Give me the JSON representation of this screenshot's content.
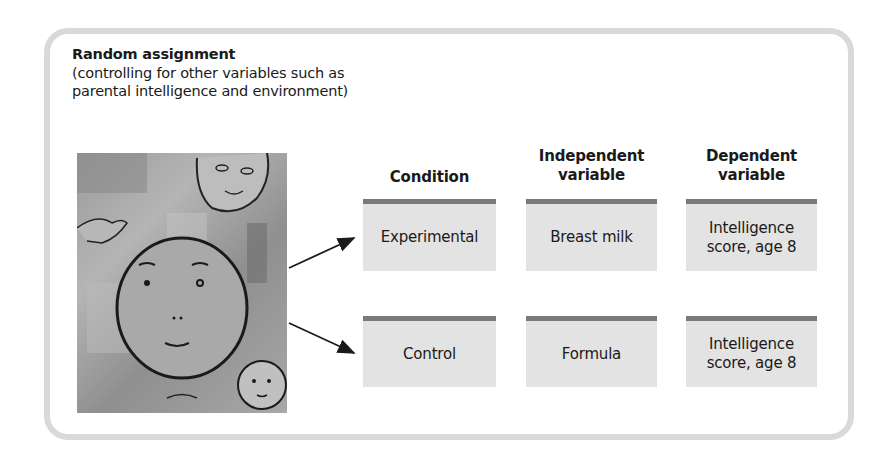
{
  "intro": {
    "title": "Random assignment",
    "description": "(controlling for other variables such as parental intelligence and environment)"
  },
  "illustration": {
    "subject": "children-faces-artwork",
    "colors": {
      "background": "#a0a0a0",
      "line": "#1a1a1a"
    }
  },
  "columns": [
    {
      "header": "Condition"
    },
    {
      "header_line1": "Independent",
      "header_line2": "variable"
    },
    {
      "header_line1": "Dependent",
      "header_line2": "variable"
    }
  ],
  "rows": [
    {
      "condition": "Experimental",
      "independent": "Breast milk",
      "dependent_line1": "Intelligence",
      "dependent_line2": "score, age 8"
    },
    {
      "condition": "Control",
      "independent": "Formula",
      "dependent_line1": "Intelligence",
      "dependent_line2": "score, age 8"
    }
  ],
  "colors": {
    "frame": "#d9d9d9",
    "box_fill": "#e3e3e3",
    "box_top_bar": "#7a7a7a",
    "text": "#1a1a1a"
  }
}
